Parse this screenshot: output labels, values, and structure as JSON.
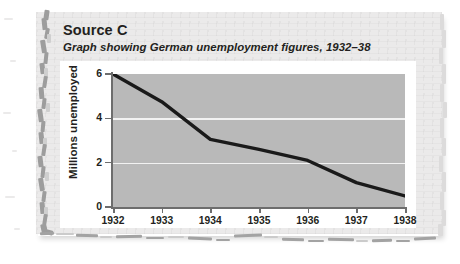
{
  "source": {
    "title": "Source C",
    "subtitle": "Graph showing German unemployment figures, 1932–38"
  },
  "colors": {
    "paper": "#ebeaea",
    "tear_edge": "#9d9d9d",
    "card": "#ffffff",
    "plot_background": "#b9b9b9",
    "gridline": "#f2f2f2",
    "axis": "#6d6d6d",
    "line": "#1a1a1a",
    "text": "#231f20"
  },
  "chart_data": {
    "type": "line",
    "title": "",
    "xlabel": "",
    "ylabel": "Millions unemployed",
    "categories": [
      "1932",
      "1933",
      "1934",
      "1935",
      "1936",
      "1937",
      "1938"
    ],
    "x": [
      1932,
      1933,
      1934,
      1935,
      1936,
      1937,
      1938
    ],
    "values": [
      6.0,
      4.75,
      3.05,
      2.6,
      2.1,
      1.1,
      0.5
    ],
    "series": [
      {
        "name": "Millions unemployed",
        "values": [
          6.0,
          4.75,
          3.05,
          2.6,
          2.1,
          1.1,
          0.5
        ]
      }
    ],
    "ylim": [
      0,
      6
    ],
    "xlim": [
      1932,
      1938
    ],
    "yticks": [
      0,
      2,
      4,
      6
    ],
    "ytick_labels": [
      "0",
      "2",
      "4",
      "6"
    ],
    "xtick_labels": [
      "1932",
      "1933",
      "1934",
      "1935",
      "1936",
      "1937",
      "1938"
    ],
    "gridlines": {
      "y": [
        2,
        4
      ],
      "x": []
    },
    "legend": null,
    "legend_position": "none",
    "grid": true
  }
}
